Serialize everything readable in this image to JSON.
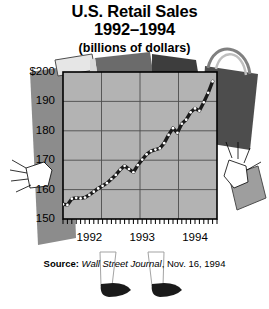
{
  "title": {
    "line1": "U.S. Retail Sales",
    "line2": "1992–1994",
    "line3": "(billions of dollars)"
  },
  "source": {
    "label": "Source:",
    "publication": "Wall Street Journal",
    "date": ", Nov. 16, 1994"
  },
  "colors": {
    "background": "#ffffff",
    "plot_fill": "#b3b3b3",
    "bag_dark": "#666666",
    "bag_mid": "#8c8c8c",
    "bag_light": "#cccccc",
    "line": "#1a1a1a",
    "marker_fill": "#ffffff",
    "grid": "#4d4d4d",
    "axis": "#000000",
    "text": "#000000"
  },
  "chart_data": {
    "type": "line",
    "title": "U.S. Retail Sales 1992–1994 (billions of dollars)",
    "xlabel": "",
    "ylabel": "billions of dollars",
    "ylim": [
      150,
      200
    ],
    "yticks": [
      150,
      160,
      170,
      180,
      190,
      200
    ],
    "ytick_labels": [
      "150",
      "160",
      "170",
      "180",
      "190",
      "$200"
    ],
    "xlim": [
      0,
      35
    ],
    "xtick_labels": [
      "1992",
      "1993",
      "1994"
    ],
    "xtick_positions": [
      6,
      18,
      30
    ],
    "grid": true,
    "legend": null,
    "minor_ticks": "monthly",
    "series": [
      {
        "name": "U.S. Retail Sales",
        "x": [
          0,
          1,
          2,
          3,
          4,
          5,
          6,
          7,
          8,
          9,
          10,
          11,
          12,
          13,
          14,
          15,
          16,
          17,
          18,
          19,
          20,
          21,
          22,
          23,
          24,
          25,
          26,
          27,
          28,
          29,
          30,
          31,
          32,
          33,
          34
        ],
        "values": [
          155.0,
          154.8,
          156.9,
          157.2,
          157.0,
          157.3,
          158.2,
          159.3,
          160.4,
          161.3,
          162.2,
          163.6,
          165.0,
          166.8,
          168.1,
          167.0,
          165.9,
          168.3,
          170.2,
          172.0,
          173.1,
          173.6,
          174.0,
          175.8,
          178.6,
          180.9,
          179.3,
          182.4,
          183.8,
          186.3,
          187.6,
          186.8,
          189.7,
          192.9,
          196.8
        ]
      }
    ]
  },
  "icons": {
    "hand_left": "hand-icon",
    "hand_right": "hand-icon",
    "bag_left": "shopping-bag-icon",
    "bag_right": "shopping-bag-icon",
    "legs": "shopper-legs-icon"
  }
}
